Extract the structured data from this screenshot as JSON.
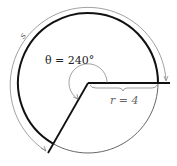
{
  "diagram": {
    "angle_label": "θ = 240°",
    "radius_label": "r = 4",
    "arc_length_label": "s",
    "colors": {
      "bold_stroke": "#111111",
      "thin_stroke": "#555555",
      "label_text": "#222222",
      "radius_label_text": "#666666"
    }
  }
}
